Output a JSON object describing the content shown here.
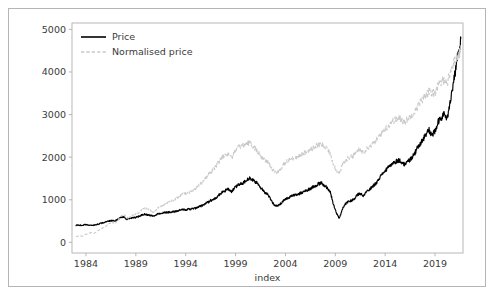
{
  "chart_data": {
    "type": "line",
    "title": "",
    "xlabel": "index",
    "ylabel": "",
    "xlim": [
      1982.6,
      2021.8
    ],
    "ylim": [
      -250,
      5150
    ],
    "grid": false,
    "legend_position": "upper left",
    "xticks": [
      1984,
      1989,
      1994,
      1999,
      2004,
      2009,
      2014,
      2019
    ],
    "xtick_labels": [
      "1984",
      "1989",
      "1994",
      "1999",
      "2004",
      "2009",
      "2014",
      "2019"
    ],
    "yticks": [
      0,
      1000,
      2000,
      3000,
      4000,
      5000
    ],
    "ytick_labels": [
      "0",
      "1000",
      "2000",
      "3000",
      "4000",
      "5000"
    ],
    "series": [
      {
        "name": "Price",
        "color": "#000000",
        "linestyle": "solid",
        "x": [
          1983.0,
          1983.3,
          1983.6,
          1983.9,
          1984.2,
          1984.5,
          1984.8,
          1985.1,
          1985.4,
          1985.7,
          1986.0,
          1986.3,
          1986.6,
          1986.9,
          1987.2,
          1987.5,
          1987.8,
          1988.1,
          1988.4,
          1988.7,
          1989.0,
          1989.3,
          1989.6,
          1989.9,
          1990.2,
          1990.5,
          1990.8,
          1991.1,
          1991.4,
          1991.7,
          1992.0,
          1992.3,
          1992.6,
          1992.9,
          1993.2,
          1993.5,
          1993.8,
          1994.1,
          1994.4,
          1994.7,
          1995.0,
          1995.3,
          1995.6,
          1995.9,
          1996.2,
          1996.5,
          1996.8,
          1997.1,
          1997.4,
          1997.7,
          1998.0,
          1998.3,
          1998.6,
          1998.9,
          1999.2,
          1999.5,
          1999.8,
          2000.1,
          2000.4,
          2000.7,
          2001.0,
          2001.3,
          2001.6,
          2001.9,
          2002.2,
          2002.5,
          2002.8,
          2003.1,
          2003.4,
          2003.7,
          2004.0,
          2004.3,
          2004.6,
          2004.9,
          2005.2,
          2005.5,
          2005.8,
          2006.1,
          2006.4,
          2006.7,
          2007.0,
          2007.3,
          2007.6,
          2007.9,
          2008.2,
          2008.5,
          2008.8,
          2009.1,
          2009.4,
          2009.7,
          2010.0,
          2010.3,
          2010.6,
          2010.9,
          2011.2,
          2011.5,
          2011.8,
          2012.1,
          2012.4,
          2012.7,
          2013.0,
          2013.3,
          2013.6,
          2013.9,
          2014.2,
          2014.5,
          2014.8,
          2015.1,
          2015.4,
          2015.7,
          2016.0,
          2016.3,
          2016.6,
          2016.9,
          2017.2,
          2017.5,
          2017.8,
          2018.1,
          2018.4,
          2018.7,
          2019.0,
          2019.3,
          2019.6,
          2019.9,
          2020.2,
          2020.5,
          2020.8,
          2021.1,
          2021.4,
          2021.6
        ],
        "y": [
          400,
          405,
          400,
          415,
          410,
          400,
          405,
          420,
          440,
          460,
          480,
          500,
          510,
          505,
          540,
          590,
          600,
          540,
          560,
          575,
          585,
          610,
          640,
          660,
          645,
          630,
          610,
          660,
          680,
          690,
          700,
          710,
          715,
          720,
          740,
          760,
          770,
          770,
          780,
          790,
          800,
          830,
          860,
          900,
          940,
          980,
          1010,
          1060,
          1130,
          1180,
          1220,
          1250,
          1180,
          1280,
          1340,
          1380,
          1400,
          1470,
          1500,
          1460,
          1420,
          1350,
          1260,
          1180,
          1140,
          1020,
          900,
          850,
          880,
          960,
          1020,
          1050,
          1080,
          1110,
          1130,
          1150,
          1180,
          1220,
          1250,
          1290,
          1330,
          1370,
          1390,
          1340,
          1280,
          1180,
          900,
          700,
          560,
          780,
          900,
          960,
          980,
          1020,
          1120,
          1140,
          1080,
          1180,
          1240,
          1300,
          1370,
          1470,
          1570,
          1660,
          1720,
          1800,
          1870,
          1900,
          1930,
          1860,
          1830,
          1900,
          1980,
          2060,
          2200,
          2320,
          2420,
          2540,
          2630,
          2520,
          2600,
          2820,
          2900,
          3050,
          2850,
          3300,
          3700,
          4100,
          4500,
          4800
        ]
      },
      {
        "name": "Normalised price",
        "color": "#c9c9c9",
        "linestyle": "dashed",
        "x": [
          1983.0,
          1983.3,
          1983.6,
          1983.9,
          1984.2,
          1984.5,
          1984.8,
          1985.1,
          1985.4,
          1985.7,
          1986.0,
          1986.3,
          1986.6,
          1986.9,
          1987.2,
          1987.5,
          1987.8,
          1988.1,
          1988.4,
          1988.7,
          1989.0,
          1989.3,
          1989.6,
          1989.9,
          1990.2,
          1990.5,
          1990.8,
          1991.1,
          1991.4,
          1991.7,
          1992.0,
          1992.3,
          1992.6,
          1992.9,
          1993.2,
          1993.5,
          1993.8,
          1994.1,
          1994.4,
          1994.7,
          1995.0,
          1995.3,
          1995.6,
          1995.9,
          1996.2,
          1996.5,
          1996.8,
          1997.1,
          1997.4,
          1997.7,
          1998.0,
          1998.3,
          1998.6,
          1998.9,
          1999.2,
          1999.5,
          1999.8,
          2000.1,
          2000.4,
          2000.7,
          2001.0,
          2001.3,
          2001.6,
          2001.9,
          2002.2,
          2002.5,
          2002.8,
          2003.1,
          2003.4,
          2003.7,
          2004.0,
          2004.3,
          2004.6,
          2004.9,
          2005.2,
          2005.5,
          2005.8,
          2006.1,
          2006.4,
          2006.7,
          2007.0,
          2007.3,
          2007.6,
          2007.9,
          2008.2,
          2008.5,
          2008.8,
          2009.1,
          2009.4,
          2009.7,
          2010.0,
          2010.3,
          2010.6,
          2010.9,
          2011.2,
          2011.5,
          2011.8,
          2012.1,
          2012.4,
          2012.7,
          2013.0,
          2013.3,
          2013.6,
          2013.9,
          2014.2,
          2014.5,
          2014.8,
          2015.1,
          2015.4,
          2015.7,
          2016.0,
          2016.3,
          2016.6,
          2016.9,
          2017.2,
          2017.5,
          2017.8,
          2018.1,
          2018.4,
          2018.7,
          2019.0,
          2019.3,
          2019.6,
          2019.9,
          2020.2,
          2020.5,
          2020.8,
          2021.1,
          2021.4,
          2021.6
        ],
        "y": [
          130,
          160,
          140,
          180,
          200,
          230,
          210,
          260,
          300,
          340,
          380,
          430,
          470,
          440,
          520,
          610,
          660,
          560,
          600,
          640,
          660,
          700,
          760,
          800,
          780,
          740,
          700,
          780,
          830,
          860,
          900,
          940,
          970,
          1000,
          1060,
          1110,
          1140,
          1150,
          1180,
          1220,
          1260,
          1330,
          1400,
          1480,
          1560,
          1650,
          1720,
          1810,
          1920,
          2010,
          2060,
          2090,
          1980,
          2120,
          2210,
          2250,
          2270,
          2330,
          2330,
          2270,
          2200,
          2110,
          2000,
          1920,
          1900,
          1780,
          1680,
          1650,
          1700,
          1800,
          1880,
          1920,
          1950,
          1990,
          2010,
          2040,
          2080,
          2130,
          2160,
          2200,
          2250,
          2290,
          2300,
          2250,
          2180,
          2080,
          1850,
          1700,
          1620,
          1800,
          1920,
          1980,
          2010,
          2060,
          2150,
          2170,
          2120,
          2200,
          2250,
          2300,
          2360,
          2460,
          2560,
          2650,
          2710,
          2790,
          2860,
          2890,
          2920,
          2860,
          2840,
          2900,
          2980,
          3050,
          3170,
          3280,
          3370,
          3470,
          3550,
          3470,
          3530,
          3680,
          3740,
          3840,
          3720,
          3980,
          4180,
          4320,
          4440,
          4520
        ]
      }
    ]
  },
  "legend": {
    "entries": [
      {
        "label": "Price",
        "style": "solid"
      },
      {
        "label": "Normalised price",
        "style": "dashed"
      }
    ]
  }
}
